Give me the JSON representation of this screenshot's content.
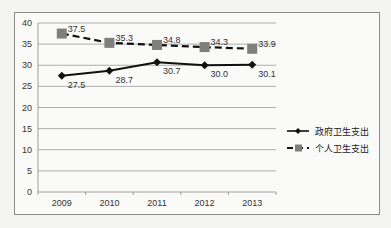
{
  "chart_data": {
    "type": "line",
    "title": "",
    "xlabel": "",
    "ylabel": "",
    "categories": [
      "2009",
      "2010",
      "2011",
      "2012",
      "2013"
    ],
    "series": [
      {
        "name": "政府卫生支出",
        "values": [
          27.5,
          28.7,
          30.7,
          30.0,
          30.1
        ],
        "labels": [
          "27.5",
          "28.7",
          "30.7",
          "30.0",
          "30.1"
        ],
        "style": "solid",
        "marker": "diamond",
        "color": "#111111"
      },
      {
        "name": "个人卫生支出",
        "values": [
          37.5,
          35.3,
          34.8,
          34.3,
          33.9
        ],
        "labels": [
          "37.5",
          "35.3",
          "34.8",
          "34.3",
          "33.9"
        ],
        "style": "dashed",
        "marker": "square",
        "color": "#111111",
        "marker_color": "#7f7f7f"
      }
    ],
    "ylim": [
      0,
      40
    ],
    "yticks": [
      "0",
      "5",
      "10",
      "15",
      "20",
      "25",
      "30",
      "35",
      "40"
    ],
    "grid": true,
    "legend_position": "right"
  }
}
